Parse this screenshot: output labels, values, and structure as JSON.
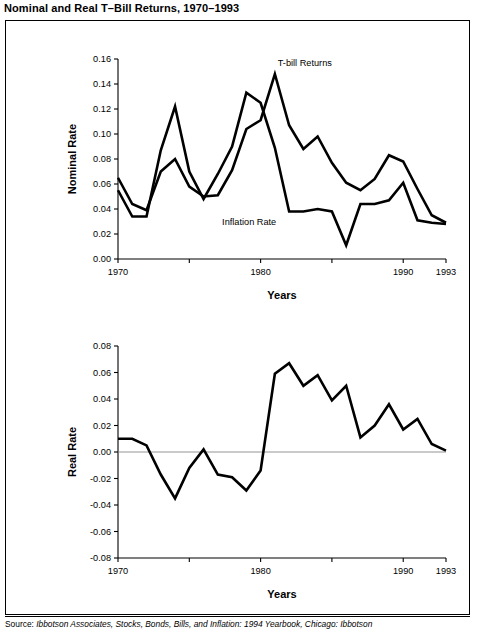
{
  "figure": {
    "title": "Nominal and Real T–Bill Returns, 1970–1993",
    "caption_lead": "Source:",
    "caption_rest": " Ibbotson Associates, Stocks, Bonds, Bills, and Inflation: 1994 Yearbook, Chicago: Ibbotson"
  },
  "chart_data": [
    {
      "id": "nominal",
      "type": "line",
      "title": "",
      "xlabel": "Years",
      "ylabel": "Nominal Rate",
      "xlim": [
        1970,
        1993
      ],
      "ylim": [
        0.0,
        0.16
      ],
      "grid": false,
      "legend": "inline-annotations",
      "xticks": [
        1970,
        1975,
        1980,
        1985,
        1990,
        1993
      ],
      "xticklabels": [
        "1970",
        "",
        "1980",
        "",
        "1990",
        "1993"
      ],
      "yticks": [
        0.0,
        0.02,
        0.04,
        0.06,
        0.08,
        0.1,
        0.12,
        0.14,
        0.16
      ],
      "yticklabels": [
        "0.00",
        "0.02",
        "0.04",
        "0.06",
        "0.08",
        "0.10",
        "0.12",
        "0.14",
        "0.16"
      ],
      "x": [
        1970,
        1971,
        1972,
        1973,
        1974,
        1975,
        1976,
        1977,
        1978,
        1979,
        1980,
        1981,
        1982,
        1983,
        1984,
        1985,
        1986,
        1987,
        1988,
        1989,
        1990,
        1991,
        1992,
        1993
      ],
      "series": [
        {
          "name": "T-bill Returns",
          "annotation": "T-bill Returns",
          "values": [
            0.065,
            0.044,
            0.039,
            0.07,
            0.08,
            0.058,
            0.05,
            0.051,
            0.071,
            0.104,
            0.111,
            0.148,
            0.107,
            0.088,
            0.098,
            0.077,
            0.061,
            0.055,
            0.064,
            0.083,
            0.078,
            0.056,
            0.035,
            0.029
          ]
        },
        {
          "name": "Inflation Rate",
          "annotation": "Inflation Rate",
          "values": [
            0.055,
            0.034,
            0.034,
            0.087,
            0.122,
            0.07,
            0.048,
            0.068,
            0.09,
            0.133,
            0.125,
            0.089,
            0.038,
            0.038,
            0.04,
            0.038,
            0.011,
            0.044,
            0.044,
            0.047,
            0.061,
            0.031,
            0.029,
            0.028
          ]
        }
      ]
    },
    {
      "id": "real",
      "type": "line",
      "title": "",
      "xlabel": "Years",
      "ylabel": "Real Rate",
      "xlim": [
        1970,
        1993
      ],
      "ylim": [
        -0.08,
        0.08
      ],
      "grid": false,
      "zero_reference_line": true,
      "xticks": [
        1970,
        1975,
        1980,
        1985,
        1990,
        1993
      ],
      "xticklabels": [
        "1970",
        "",
        "1980",
        "",
        "1990",
        "1993"
      ],
      "yticks": [
        -0.08,
        -0.06,
        -0.04,
        -0.02,
        0.0,
        0.02,
        0.04,
        0.06,
        0.08
      ],
      "yticklabels": [
        "-0.08",
        "-0.06",
        "-0.04",
        "-0.02",
        "0.00",
        "0.02",
        "0.04",
        "0.06",
        "0.08"
      ],
      "x": [
        1970,
        1971,
        1972,
        1973,
        1974,
        1975,
        1976,
        1977,
        1978,
        1979,
        1980,
        1981,
        1982,
        1983,
        1984,
        1985,
        1986,
        1987,
        1988,
        1989,
        1990,
        1991,
        1992,
        1993
      ],
      "series": [
        {
          "name": "Real Rate",
          "values": [
            0.01,
            0.01,
            0.005,
            -0.017,
            -0.035,
            -0.012,
            0.002,
            -0.017,
            -0.019,
            -0.029,
            -0.014,
            0.059,
            0.067,
            0.05,
            0.058,
            0.039,
            0.05,
            0.011,
            0.02,
            0.036,
            0.017,
            0.025,
            0.006,
            0.001
          ]
        }
      ]
    }
  ]
}
